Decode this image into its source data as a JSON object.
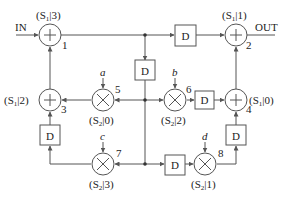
{
  "diagram": {
    "input_label": "IN",
    "output_label": "OUT",
    "delay_label": "D",
    "adders": [
      {
        "id": "1",
        "tag": "(S",
        "sub": "1",
        "tag_end": "|3)"
      },
      {
        "id": "2",
        "tag": "(S",
        "sub": "1",
        "tag_end": "|1)"
      },
      {
        "id": "3",
        "tag": "(S",
        "sub": "1",
        "tag_end": "|2)"
      },
      {
        "id": "4",
        "tag": "(S",
        "sub": "1",
        "tag_end": "|0)"
      }
    ],
    "multipliers": [
      {
        "id": "5",
        "coef": "a",
        "tag": "(S",
        "sub": "2",
        "tag_end": "|0)"
      },
      {
        "id": "6",
        "coef": "b",
        "tag": "(S",
        "sub": "2",
        "tag_end": "|2)"
      },
      {
        "id": "7",
        "coef": "c",
        "tag": "(S",
        "sub": "2",
        "tag_end": "|3)"
      },
      {
        "id": "8",
        "coef": "d",
        "tag": "(S",
        "sub": "2",
        "tag_end": "|1)"
      }
    ]
  }
}
